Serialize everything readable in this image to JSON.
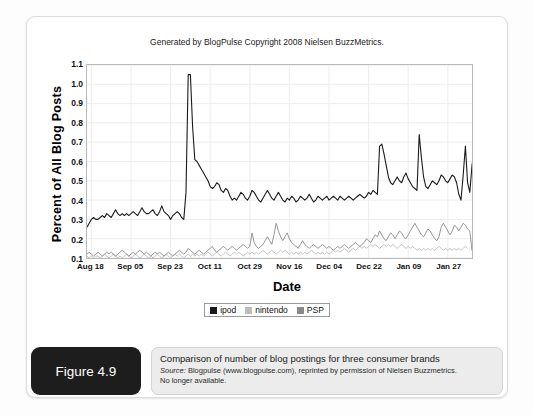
{
  "figure": {
    "badge_label": "Figure 4.9",
    "caption_title": "Comparison of number of blog postings for three consumer brands",
    "caption_source_prefix": "Source:",
    "caption_source_text": " Blogpulse (www.blogpulse.com), reprinted by permission of Nielsen Buzzmetrics.",
    "caption_note": "No longer available."
  },
  "legend": {
    "items": [
      {
        "label": "ipod",
        "color": "#1a1a1a"
      },
      {
        "label": "nintendo",
        "color": "#bcbcbc"
      },
      {
        "label": "PSP",
        "color": "#8a8a8a"
      }
    ]
  },
  "chart_data": {
    "type": "line",
    "title": "Generated by BlogPulse Copyright 2008 Nielsen BuzzMetrics.",
    "xlabel": "Date",
    "ylabel": "Percent of All Blog Posts",
    "ylim": [
      0.1,
      1.1
    ],
    "yticks": [
      1.1,
      1.0,
      0.9,
      0.8,
      0.7,
      0.6,
      0.5,
      0.4,
      0.3,
      0.2,
      0.1
    ],
    "grid": true,
    "legend_position": "bottom",
    "tick_labels": [
      "Aug 18",
      "Sep 05",
      "Sep 23",
      "Oct 11",
      "Oct 29",
      "Nov 16",
      "Dec 04",
      "Dec 22",
      "Jan 09",
      "Jan 27"
    ],
    "tick_positions": [
      2,
      20,
      38,
      56,
      74,
      92,
      110,
      128,
      146,
      164
    ],
    "x_count": 176,
    "series": [
      {
        "name": "ipod",
        "color": "#1a1a1a",
        "values": [
          0.26,
          0.28,
          0.3,
          0.31,
          0.3,
          0.3,
          0.31,
          0.32,
          0.31,
          0.33,
          0.32,
          0.31,
          0.33,
          0.35,
          0.33,
          0.32,
          0.33,
          0.32,
          0.33,
          0.32,
          0.33,
          0.34,
          0.33,
          0.32,
          0.34,
          0.36,
          0.34,
          0.33,
          0.33,
          0.34,
          0.35,
          0.33,
          0.32,
          0.34,
          0.37,
          0.34,
          0.33,
          0.32,
          0.3,
          0.32,
          0.33,
          0.34,
          0.33,
          0.31,
          0.3,
          0.44,
          1.05,
          1.05,
          0.78,
          0.61,
          0.6,
          0.58,
          0.56,
          0.54,
          0.52,
          0.5,
          0.47,
          0.46,
          0.47,
          0.49,
          0.48,
          0.45,
          0.44,
          0.46,
          0.45,
          0.42,
          0.4,
          0.41,
          0.4,
          0.42,
          0.44,
          0.43,
          0.41,
          0.4,
          0.42,
          0.45,
          0.44,
          0.42,
          0.4,
          0.39,
          0.41,
          0.43,
          0.45,
          0.43,
          0.41,
          0.4,
          0.42,
          0.44,
          0.42,
          0.4,
          0.39,
          0.41,
          0.4,
          0.42,
          0.41,
          0.39,
          0.4,
          0.42,
          0.41,
          0.4,
          0.41,
          0.43,
          0.41,
          0.39,
          0.4,
          0.42,
          0.41,
          0.4,
          0.41,
          0.42,
          0.4,
          0.41,
          0.42,
          0.41,
          0.4,
          0.42,
          0.41,
          0.4,
          0.41,
          0.42,
          0.41,
          0.4,
          0.41,
          0.42,
          0.43,
          0.42,
          0.41,
          0.42,
          0.44,
          0.43,
          0.45,
          0.44,
          0.43,
          0.68,
          0.69,
          0.64,
          0.58,
          0.52,
          0.49,
          0.48,
          0.5,
          0.52,
          0.5,
          0.49,
          0.52,
          0.54,
          0.51,
          0.49,
          0.47,
          0.46,
          0.45,
          0.74,
          0.62,
          0.52,
          0.47,
          0.46,
          0.48,
          0.5,
          0.49,
          0.48,
          0.5,
          0.53,
          0.52,
          0.5,
          0.49,
          0.51,
          0.53,
          0.52,
          0.49,
          0.43,
          0.4,
          0.53,
          0.68,
          0.49,
          0.44,
          0.58,
          0.66,
          0.5
        ],
        "peak_value": 1.05,
        "peak_label_date": "Sep 05"
      },
      {
        "name": "PSP",
        "color": "#8a8a8a",
        "values": [
          0.12,
          0.13,
          0.12,
          0.11,
          0.12,
          0.13,
          0.12,
          0.11,
          0.12,
          0.13,
          0.12,
          0.13,
          0.12,
          0.11,
          0.12,
          0.13,
          0.14,
          0.13,
          0.12,
          0.11,
          0.12,
          0.13,
          0.12,
          0.13,
          0.14,
          0.13,
          0.12,
          0.13,
          0.12,
          0.11,
          0.12,
          0.13,
          0.12,
          0.13,
          0.12,
          0.11,
          0.12,
          0.13,
          0.12,
          0.11,
          0.12,
          0.13,
          0.14,
          0.13,
          0.12,
          0.13,
          0.15,
          0.14,
          0.13,
          0.12,
          0.13,
          0.14,
          0.13,
          0.12,
          0.13,
          0.14,
          0.15,
          0.16,
          0.14,
          0.13,
          0.14,
          0.15,
          0.16,
          0.15,
          0.14,
          0.15,
          0.16,
          0.15,
          0.14,
          0.15,
          0.16,
          0.17,
          0.16,
          0.15,
          0.16,
          0.23,
          0.18,
          0.16,
          0.15,
          0.16,
          0.17,
          0.19,
          0.21,
          0.19,
          0.17,
          0.22,
          0.28,
          0.24,
          0.21,
          0.19,
          0.21,
          0.23,
          0.2,
          0.18,
          0.17,
          0.16,
          0.15,
          0.17,
          0.19,
          0.17,
          0.16,
          0.15,
          0.16,
          0.17,
          0.16,
          0.15,
          0.16,
          0.17,
          0.16,
          0.15,
          0.16,
          0.15,
          0.14,
          0.15,
          0.16,
          0.15,
          0.16,
          0.17,
          0.16,
          0.15,
          0.16,
          0.17,
          0.18,
          0.17,
          0.16,
          0.17,
          0.18,
          0.2,
          0.19,
          0.18,
          0.2,
          0.22,
          0.21,
          0.24,
          0.22,
          0.2,
          0.19,
          0.21,
          0.23,
          0.22,
          0.2,
          0.22,
          0.24,
          0.23,
          0.21,
          0.2,
          0.22,
          0.24,
          0.26,
          0.28,
          0.26,
          0.24,
          0.22,
          0.21,
          0.23,
          0.25,
          0.24,
          0.22,
          0.2,
          0.19,
          0.21,
          0.26,
          0.28,
          0.26,
          0.24,
          0.22,
          0.24,
          0.27,
          0.26,
          0.24,
          0.26,
          0.28,
          0.27,
          0.25,
          0.24,
          0.14,
          0.22
        ]
      },
      {
        "name": "nintendo",
        "color": "#bcbcbc",
        "values": [
          0.11,
          0.1,
          0.11,
          0.1,
          0.11,
          0.11,
          0.1,
          0.11,
          0.12,
          0.11,
          0.1,
          0.11,
          0.12,
          0.11,
          0.1,
          0.11,
          0.1,
          0.11,
          0.12,
          0.11,
          0.1,
          0.11,
          0.12,
          0.11,
          0.1,
          0.11,
          0.12,
          0.11,
          0.1,
          0.11,
          0.1,
          0.11,
          0.12,
          0.11,
          0.1,
          0.11,
          0.12,
          0.11,
          0.1,
          0.11,
          0.12,
          0.11,
          0.12,
          0.11,
          0.1,
          0.11,
          0.12,
          0.11,
          0.12,
          0.11,
          0.12,
          0.11,
          0.12,
          0.11,
          0.12,
          0.13,
          0.12,
          0.11,
          0.12,
          0.13,
          0.12,
          0.11,
          0.12,
          0.13,
          0.12,
          0.11,
          0.12,
          0.13,
          0.12,
          0.13,
          0.12,
          0.11,
          0.12,
          0.13,
          0.12,
          0.13,
          0.12,
          0.13,
          0.12,
          0.13,
          0.14,
          0.13,
          0.12,
          0.13,
          0.14,
          0.13,
          0.12,
          0.13,
          0.14,
          0.13,
          0.14,
          0.13,
          0.12,
          0.13,
          0.12,
          0.13,
          0.12,
          0.13,
          0.12,
          0.13,
          0.12,
          0.13,
          0.14,
          0.13,
          0.12,
          0.13,
          0.12,
          0.13,
          0.12,
          0.13,
          0.12,
          0.13,
          0.14,
          0.13,
          0.14,
          0.13,
          0.14,
          0.15,
          0.14,
          0.13,
          0.14,
          0.15,
          0.14,
          0.15,
          0.16,
          0.15,
          0.16,
          0.15,
          0.16,
          0.17,
          0.16,
          0.17,
          0.16,
          0.15,
          0.16,
          0.17,
          0.16,
          0.17,
          0.16,
          0.17,
          0.16,
          0.15,
          0.16,
          0.17,
          0.16,
          0.15,
          0.16,
          0.15,
          0.16,
          0.15,
          0.14,
          0.15,
          0.14,
          0.15,
          0.14,
          0.15,
          0.14,
          0.15,
          0.14,
          0.15,
          0.16,
          0.15,
          0.14,
          0.15,
          0.14,
          0.15,
          0.14,
          0.15,
          0.14,
          0.15,
          0.14,
          0.15,
          0.16,
          0.15
        ]
      }
    ]
  }
}
